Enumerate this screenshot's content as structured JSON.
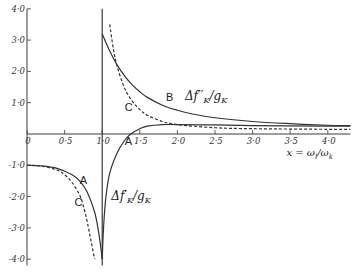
{
  "chart_data": {
    "type": "line",
    "title": "",
    "xlabel": "x = ωl/ωk",
    "ylabel": "",
    "xlim": [
      0,
      4.3
    ],
    "ylim": [
      -4.2,
      4.0
    ],
    "x_ticks": [
      0,
      0.5,
      1.0,
      1.5,
      2.0,
      2.5,
      3.0,
      3.5,
      4.0
    ],
    "x_tick_labels": [
      "0",
      "0·5",
      "1·0",
      "1·5",
      "2·0",
      "2·5",
      "3·0",
      "3·5",
      "4·0"
    ],
    "y_ticks": [
      4.0,
      3.0,
      2.0,
      1.0,
      -1.0,
      -2.0,
      -3.0,
      -4.0
    ],
    "y_tick_labels": [
      "4·0",
      "3·0",
      "2·0",
      "1·0",
      "-1·0",
      "-2·0",
      "-3·0",
      "-4·0"
    ],
    "grid": false,
    "vertical_line_x": 1.0,
    "series": [
      {
        "name": "B",
        "role": "f''",
        "style": "solid",
        "x": [
          1.0,
          1.1,
          1.2,
          1.3,
          1.4,
          1.5,
          1.6,
          1.8,
          2.0,
          2.2,
          2.5,
          3.0,
          3.5,
          4.0,
          4.3
        ],
        "values": [
          3.2,
          2.65,
          2.2,
          1.85,
          1.57,
          1.35,
          1.17,
          0.92,
          0.76,
          0.64,
          0.52,
          0.4,
          0.33,
          0.28,
          0.27
        ]
      },
      {
        "name": "C",
        "role": "f''",
        "style": "dashed",
        "x": [
          1.1,
          1.15,
          1.2,
          1.3,
          1.4,
          1.5,
          1.6,
          1.8,
          2.0,
          2.5,
          3.0,
          4.0,
          4.3
        ],
        "values": [
          3.5,
          2.7,
          2.15,
          1.45,
          1.05,
          0.78,
          0.6,
          0.4,
          0.3,
          0.2,
          0.17,
          0.15,
          0.15
        ]
      },
      {
        "name": "A",
        "role": "f' (right)",
        "style": "solid",
        "x": [
          1.0,
          1.02,
          1.05,
          1.1,
          1.2,
          1.3,
          1.38,
          1.5,
          1.6,
          1.8,
          2.0,
          2.5,
          3.0,
          4.0,
          4.3
        ],
        "values": [
          -4.0,
          -2.9,
          -2.0,
          -1.25,
          -0.6,
          -0.2,
          0.0,
          0.17,
          0.25,
          0.3,
          0.3,
          0.29,
          0.27,
          0.25,
          0.25
        ]
      },
      {
        "name": "A",
        "role": "f' (left)",
        "style": "solid",
        "x": [
          0.0,
          0.2,
          0.4,
          0.6,
          0.7,
          0.8,
          0.9,
          0.95,
          0.98,
          1.0
        ],
        "values": [
          -1.0,
          -1.02,
          -1.1,
          -1.3,
          -1.5,
          -1.85,
          -2.5,
          -3.1,
          -3.6,
          -4.0
        ]
      },
      {
        "name": "C",
        "role": "f' (left)",
        "style": "dashed",
        "x": [
          0.0,
          0.2,
          0.4,
          0.5,
          0.6,
          0.7,
          0.75,
          0.8,
          0.85,
          0.9
        ],
        "values": [
          -1.0,
          -1.03,
          -1.15,
          -1.3,
          -1.55,
          -1.95,
          -2.3,
          -2.8,
          -3.4,
          -4.0
        ]
      }
    ],
    "annotations": [
      {
        "text": "B",
        "x": 1.85,
        "y": 1.05
      },
      {
        "text": "C",
        "x": 1.3,
        "y": 0.75
      },
      {
        "text": "A",
        "x": 1.3,
        "y": -0.35
      },
      {
        "text": "A",
        "x": 0.7,
        "y": -1.6
      },
      {
        "text": "C",
        "x": 0.63,
        "y": -2.3
      }
    ],
    "function_labels": [
      {
        "main": "Δf",
        "prime": "′′",
        "sub": "K",
        "denom": "/g",
        "denom_sub": "K",
        "x": 2.1,
        "y": 1.1
      },
      {
        "main": "Δf",
        "prime": "′",
        "sub": "K",
        "denom": "/g",
        "denom_sub": "K",
        "x": 1.12,
        "y": -2.1
      }
    ],
    "axis_title_text": {
      "x": "x",
      "eq": " = ",
      "num": "ω",
      "num_sub": "l",
      "slash": "/",
      "den": "ω",
      "den_sub": "k"
    }
  }
}
